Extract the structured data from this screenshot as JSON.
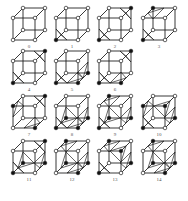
{
  "figure": {
    "colors": {
      "edge": "#222222",
      "vertex_fill_in": "#ffffff",
      "vertex_fill_on": "#111111",
      "surface": "#222222"
    },
    "cases": [
      {
        "label": "0",
        "x": 13,
        "y": 8,
        "on": []
      },
      {
        "label": "1",
        "x": 56,
        "y": 8,
        "on": [
          0
        ]
      },
      {
        "label": "2",
        "x": 99,
        "y": 8,
        "on": [
          0,
          6
        ]
      },
      {
        "label": "3",
        "x": 143,
        "y": 8,
        "on": [
          0,
          7
        ]
      },
      {
        "label": "4",
        "x": 13,
        "y": 51,
        "on": [
          0,
          6
        ]
      },
      {
        "label": "5",
        "x": 56,
        "y": 51,
        "on": [
          0,
          1,
          5
        ]
      },
      {
        "label": "6",
        "x": 99,
        "y": 51,
        "on": [
          0,
          1,
          6
        ]
      },
      {
        "label": "7",
        "x": 13,
        "y": 96,
        "on": [
          3,
          6,
          1
        ]
      },
      {
        "label": "8",
        "x": 56,
        "y": 96,
        "on": [
          0,
          1,
          4,
          5
        ]
      },
      {
        "label": "9",
        "x": 99,
        "y": 96,
        "on": [
          0,
          4,
          5,
          7
        ]
      },
      {
        "label": "10",
        "x": 143,
        "y": 96,
        "on": [
          0,
          3,
          2,
          5
        ]
      },
      {
        "label": "11",
        "x": 13,
        "y": 141,
        "on": [
          0,
          4,
          5,
          6
        ]
      },
      {
        "label": "12",
        "x": 56,
        "y": 141,
        "on": [
          1,
          4,
          5,
          7
        ]
      },
      {
        "label": "13",
        "x": 99,
        "y": 141,
        "on": [
          0,
          2,
          5,
          7
        ]
      },
      {
        "label": "14",
        "x": 143,
        "y": 141,
        "on": [
          1,
          4,
          5,
          7
        ]
      }
    ]
  }
}
